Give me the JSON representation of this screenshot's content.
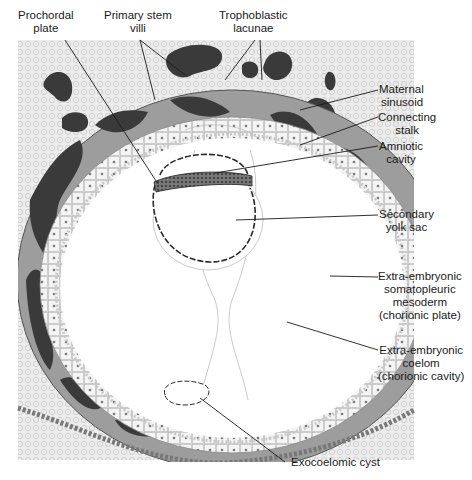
{
  "figure": {
    "colors": {
      "decidua_bg": "#e6e6e6",
      "lacuna": "#3a3a3a",
      "syncytio": "#9d9d9d",
      "cytotrophoblast": "#f2f2f2",
      "line": "#1a1a1a",
      "epiblast": "#555555"
    }
  },
  "labels": {
    "prochordal_plate": [
      "Prochordal",
      "plate"
    ],
    "primary_stem_villi": [
      "Primary stem",
      "villi"
    ],
    "trophoblastic_lacunae": [
      "Trophoblastic",
      "lacunae"
    ],
    "maternal_sinusoid": [
      "Maternal",
      "sinusoid"
    ],
    "connecting_stalk": [
      "Connecting",
      "stalk"
    ],
    "amniotic_cavity": [
      "Amniotic",
      "cavity"
    ],
    "secondary_yolk_sac": [
      "Secondary",
      "yolk sac"
    ],
    "somatopleuric_mesoderm": [
      "Extra-embryonic",
      "somatopleuric",
      "mesoderm",
      "(chorionic plate)"
    ],
    "extraembryonic_coelom": [
      "Extra-embryonic",
      "coelom",
      "(chorionic cavity)"
    ],
    "exocoelomic_cyst": [
      "Exocoelomic cyst"
    ]
  }
}
